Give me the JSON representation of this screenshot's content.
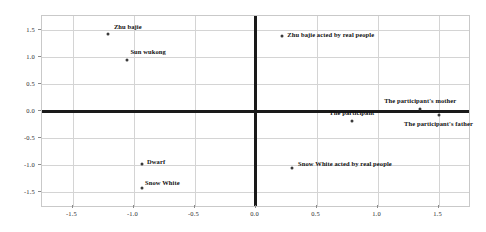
{
  "chart_data": {
    "type": "scatter",
    "title": "",
    "xlabel": "",
    "ylabel": "",
    "xlim": [
      -1.75,
      1.75
    ],
    "ylim": [
      -1.75,
      1.75
    ],
    "grid": true,
    "legend": "none",
    "xticks": [
      "-1.5",
      "-1.0",
      "-0.5",
      "0.0",
      "0.5",
      "1.0",
      "1.5"
    ],
    "xtick_values": [
      -1.5,
      -1.0,
      -0.5,
      0.0,
      0.5,
      1.0,
      1.5
    ],
    "yticks": [
      "1.5",
      "1.0",
      "0.5",
      "0.0",
      "-0.5",
      "-1.0",
      "-1.5"
    ],
    "ytick_values": [
      1.5,
      1.0,
      0.5,
      0.0,
      -0.5,
      -1.0,
      -1.5
    ],
    "points": [
      {
        "label": "Zhu bajie",
        "x": -1.21,
        "y": 1.41,
        "label_dx": 6,
        "label_dy": -8,
        "anchor": "left"
      },
      {
        "label": "Sun wukong",
        "x": -1.05,
        "y": 0.94,
        "label_dx": 3,
        "label_dy": -9,
        "anchor": "left"
      },
      {
        "label": "Zhu bajie acted by real people",
        "x": 0.22,
        "y": 1.38,
        "label_dx": 5,
        "label_dy": -2,
        "anchor": "left"
      },
      {
        "label": "The participant's mother",
        "x": 1.35,
        "y": 0.03,
        "label_dx": 0,
        "label_dy": -9,
        "anchor": "center"
      },
      {
        "label": "The participant's father",
        "x": 1.5,
        "y": -0.07,
        "label_dx": 0,
        "label_dy": 8,
        "anchor": "center"
      },
      {
        "label": "The participant",
        "x": 0.79,
        "y": -0.18,
        "label_dx": 0,
        "label_dy": -9,
        "anchor": "center"
      },
      {
        "label": "Dwarf",
        "x": -0.93,
        "y": -0.97,
        "label_dx": 5,
        "label_dy": -3,
        "anchor": "left"
      },
      {
        "label": "Snow White",
        "x": -0.93,
        "y": -1.42,
        "label_dx": 3,
        "label_dy": -6,
        "anchor": "left"
      },
      {
        "label": "Snow White acted by real people",
        "x": 0.3,
        "y": -1.05,
        "label_dx": 6,
        "label_dy": -5,
        "anchor": "left"
      }
    ]
  },
  "colors": {
    "marker": "#3a3a3a",
    "axis": "#1a1a1a",
    "grid": "#d4d4d4",
    "frame": "#c9c9c9",
    "text": "#111111"
  }
}
